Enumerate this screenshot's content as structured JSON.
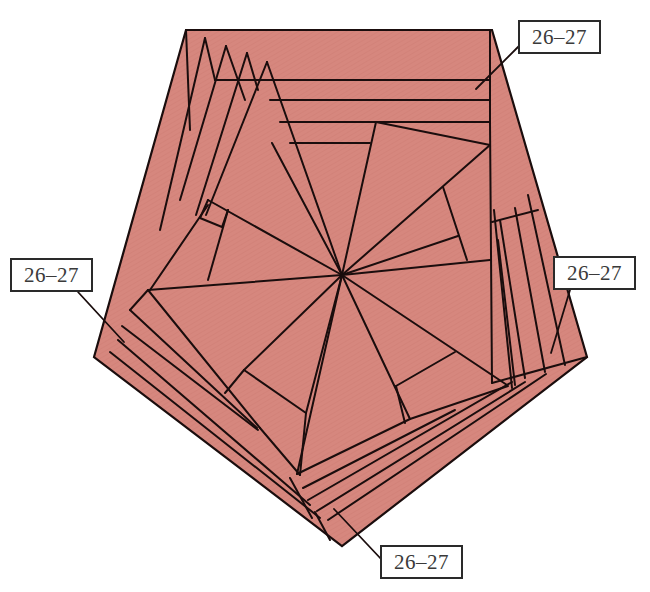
{
  "figure": {
    "type": "origami-fold-diagram",
    "shape": "pentagon",
    "fill_color": "#D6877E",
    "line_color": "#1a0d0d",
    "background": "#ffffff"
  },
  "labels": [
    {
      "id": "top-right",
      "text": "26–27",
      "box": [
        518,
        20,
        83,
        34
      ],
      "pointer_to": [
        485,
        88
      ]
    },
    {
      "id": "left",
      "text": "26–27",
      "box": [
        10,
        258,
        83,
        34
      ],
      "pointer_to": [
        124,
        342
      ]
    },
    {
      "id": "right",
      "text": "26–27",
      "box": [
        553,
        256,
        83,
        34
      ],
      "pointer_to": [
        552,
        353
      ]
    },
    {
      "id": "bottom",
      "text": "26–27",
      "box": [
        380,
        545,
        83,
        34
      ],
      "pointer_to": [
        334,
        508
      ]
    }
  ]
}
